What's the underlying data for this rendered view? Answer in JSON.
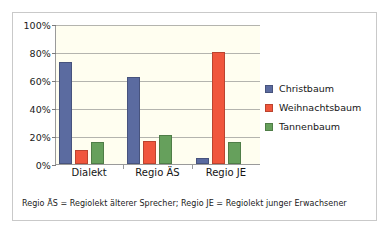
{
  "chart_data": {
    "type": "bar",
    "title": "",
    "xlabel": "",
    "ylabel": "",
    "categories": [
      "Dialekt",
      "Regio ÄS",
      "Regio JE"
    ],
    "series": [
      {
        "name": "Christbaum",
        "color": "#5b6ba0",
        "values": [
          73,
          62,
          4
        ]
      },
      {
        "name": "Weihnachtsbaum",
        "color": "#f0563c",
        "values": [
          10,
          16.5,
          80
        ]
      },
      {
        "name": "Tannenbaum",
        "color": "#66a05c",
        "values": [
          16,
          21,
          15.5
        ]
      }
    ],
    "ylim": [
      0,
      100
    ],
    "yticks": [
      0,
      20,
      40,
      60,
      80,
      100
    ],
    "ytick_labels": [
      "0%",
      "20%",
      "40%",
      "60%",
      "80%",
      "100%"
    ],
    "grid": true,
    "legend_position": "right",
    "plot_background": "#fffef0",
    "gridline_color": "#b4b4ae",
    "axis_color": "#9a9a9a",
    "frame_color": "#c9c9c9"
  },
  "footnote": {
    "text": "Regio ÄS = Regiolekt älterer Sprecher; Regio JE = Regiolekt junger Erwachsener"
  }
}
